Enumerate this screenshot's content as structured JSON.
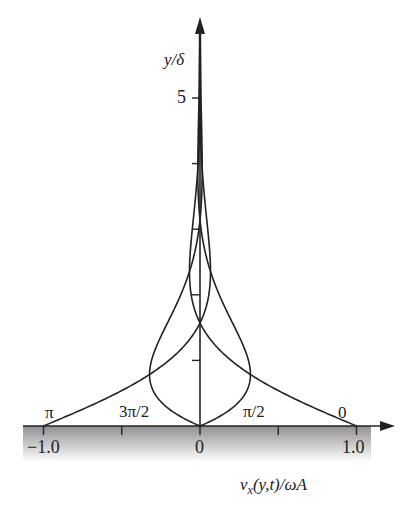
{
  "chart_data": {
    "type": "line",
    "title": "",
    "xlabel": "v_x(y,t)/ωA",
    "ylabel": "y/δ",
    "xlim": [
      -1.0,
      1.0
    ],
    "ylim": [
      0,
      6
    ],
    "x_ticks": [
      -1.0,
      -0.5,
      0,
      0.5,
      1.0
    ],
    "x_tick_labels": [
      "−1.0",
      "0",
      "1.0"
    ],
    "y_ticks": [
      1,
      2,
      3,
      4,
      5
    ],
    "y_tick_labels": [
      "5"
    ],
    "grid": false,
    "legend": "inline phase labels at curve bases",
    "series": [
      {
        "name": "0",
        "phase": 0,
        "formula": "cos(-y)·exp(-y)",
        "label_pos": "near x=1.0"
      },
      {
        "name": "π/2",
        "phase": 1.5708,
        "formula": "cos(π/2 - y)·exp(-y)",
        "label_pos": "near x=0.5"
      },
      {
        "name": "π",
        "phase": 3.1416,
        "formula": "cos(π - y)·exp(-y)",
        "label_pos": "near x=-1.0"
      },
      {
        "name": "3π/2",
        "phase": 4.7124,
        "formula": "cos(3π/2 - y)·exp(-y)",
        "label_pos": "near x=-0.5"
      }
    ],
    "wall": "shaded region below y=0"
  },
  "labels": {
    "y_axis": "y/δ",
    "x_axis": "v",
    "x_axis_sub": "x",
    "x_axis_rest": "(y,t)/ωA",
    "tick_5": "5",
    "tick_m1": "−1.0",
    "tick_0": "0",
    "tick_p1": "1.0",
    "phase_pi": "π",
    "phase_3pi2": "3π/2",
    "phase_pi2": "π/2",
    "phase_0": "0"
  },
  "colors": {
    "line": "#222222",
    "wall_top": "#9a9a9a",
    "wall_bottom": "#ffffff"
  }
}
